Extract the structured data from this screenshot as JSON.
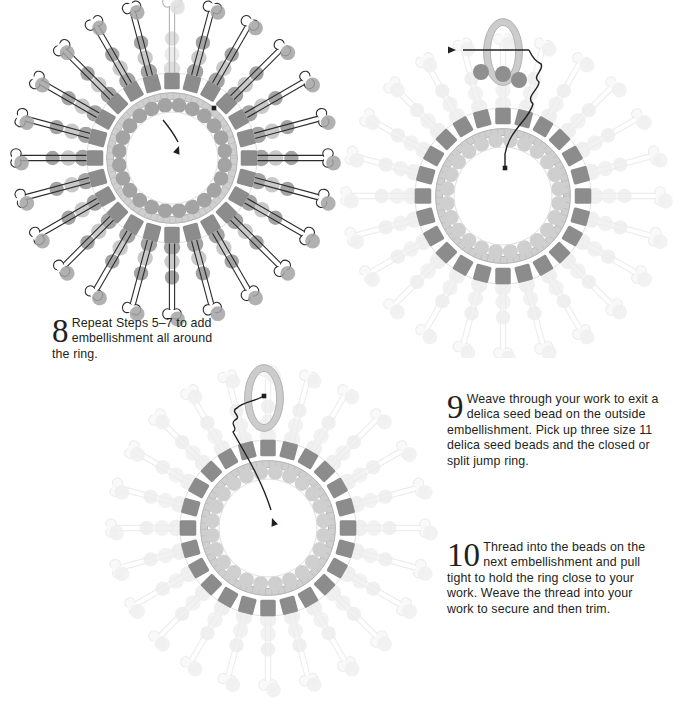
{
  "page": {
    "background": "#ffffff",
    "width": 668,
    "height": 712
  },
  "colors": {
    "bead_dark": "#8c8c8c",
    "bead_mid": "#a3a3a3",
    "bead_light": "#c9c9c9",
    "bead_faint": "#dcdcdc",
    "ring_band": "#cfcfcf",
    "ring_outline": "#b5b5b5",
    "thread": "#231f20",
    "text": "#231f20"
  },
  "steps": [
    {
      "number": "8",
      "text": "Repeat Steps 5–7 to add embellishment all around the ring.",
      "diagram": "diagram-1"
    },
    {
      "number": "9",
      "text": "Weave through your work to exit a delica seed bead on the outside embellishment. Pick up three size 11 delica seed beads and the closed or split jump ring.",
      "diagram": "diagram-2"
    },
    {
      "number": "10",
      "text": "Thread into the beads on the next embellishment and pull tight to hold the ring close to your work. Weave the thread into your work to secure and then trim.",
      "diagram": "diagram-3"
    }
  ],
  "diagrams": [
    {
      "id": "diagram-1",
      "name": "ring-with-full-embellishment",
      "center_x": 172,
      "center_y": 158,
      "inner_radius": 52,
      "band_radius": 62,
      "delica_radius": 78,
      "spoke_count": 24,
      "spoke_length": 72,
      "state": "complete",
      "annotations": [
        "thread-start-dot",
        "thread-direction-arrow",
        "ghost-embellishment"
      ]
    },
    {
      "id": "diagram-2",
      "name": "ring-with-jump-ring-pickup",
      "center_x": 503,
      "center_y": 196,
      "inner_radius": 55,
      "band_radius": 64,
      "delica_radius": 81,
      "spoke_count": 24,
      "spoke_length": 70,
      "state": "faded",
      "jump_ring": {
        "x": 503,
        "y": 52,
        "rx": 16,
        "ry": 30,
        "bead_count": 3
      },
      "annotations": [
        "thread-path",
        "needle-arrow",
        "exit-bead-dot"
      ]
    },
    {
      "id": "diagram-3",
      "name": "ring-with-jump-ring-attached",
      "center_x": 268,
      "center_y": 528,
      "inner_radius": 55,
      "band_radius": 64,
      "delica_radius": 81,
      "spoke_count": 24,
      "spoke_length": 70,
      "state": "faded",
      "jump_ring": {
        "x": 264,
        "y": 398,
        "rx": 16,
        "ry": 30,
        "bead_count": 0
      },
      "annotations": [
        "thread-path-into-work",
        "needle-arrow",
        "thread-start-dot"
      ]
    }
  ]
}
